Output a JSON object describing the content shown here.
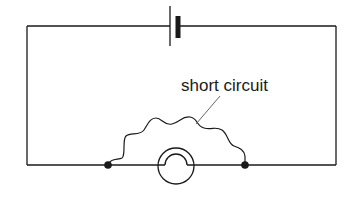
{
  "diagram": {
    "type": "circuit",
    "components": [
      {
        "id": "battery",
        "kind": "cell",
        "position": "top-center"
      },
      {
        "id": "bulb",
        "kind": "lamp",
        "position": "bottom-center"
      },
      {
        "id": "junction-left",
        "kind": "junction-dot"
      },
      {
        "id": "junction-right",
        "kind": "junction-dot"
      },
      {
        "id": "short-wire",
        "kind": "wire",
        "connects": [
          "junction-left",
          "junction-right"
        ]
      }
    ],
    "labels": {
      "short_circuit": "short circuit"
    },
    "colors": {
      "stroke": "#1a1a1a",
      "leader": "#555555",
      "background": "#ffffff"
    }
  }
}
